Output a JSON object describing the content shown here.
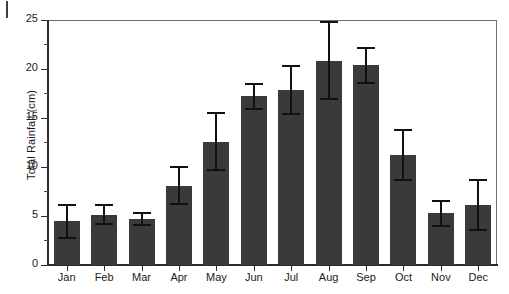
{
  "chart_data": {
    "type": "bar",
    "title": "",
    "xlabel": "",
    "ylabel": "Total Rainfall (cm)",
    "categories": [
      "Jan",
      "Feb",
      "Mar",
      "Apr",
      "May",
      "Jun",
      "Jul",
      "Aug",
      "Sep",
      "Oct",
      "Nov",
      "Dec"
    ],
    "values": [
      4.5,
      5.1,
      4.7,
      8.1,
      12.6,
      17.2,
      17.9,
      20.8,
      20.4,
      11.2,
      5.3,
      6.1
    ],
    "error_upper": [
      6.1,
      6.1,
      5.3,
      10.0,
      15.5,
      18.5,
      20.3,
      24.8,
      22.1,
      13.8,
      6.5,
      8.7
    ],
    "error_lower": [
      2.8,
      4.2,
      4.1,
      6.2,
      9.7,
      15.9,
      15.4,
      16.9,
      18.6,
      8.7,
      4.0,
      3.6
    ],
    "ylim": [
      0,
      25
    ],
    "ytick_labels": [
      "0",
      "5",
      "10",
      "15",
      "20",
      "25"
    ],
    "ytick_values": [
      0,
      5,
      10,
      15,
      20,
      25
    ],
    "yminor_values": [
      2.5,
      7.5,
      12.5,
      17.5,
      22.5
    ],
    "grid": false,
    "legend": null,
    "bar_color": "#3a3a3a",
    "error_color": "#111111",
    "axis_color": "#2b2b2b",
    "frame_color": "#6e6e6e",
    "background": "#ffffff"
  }
}
